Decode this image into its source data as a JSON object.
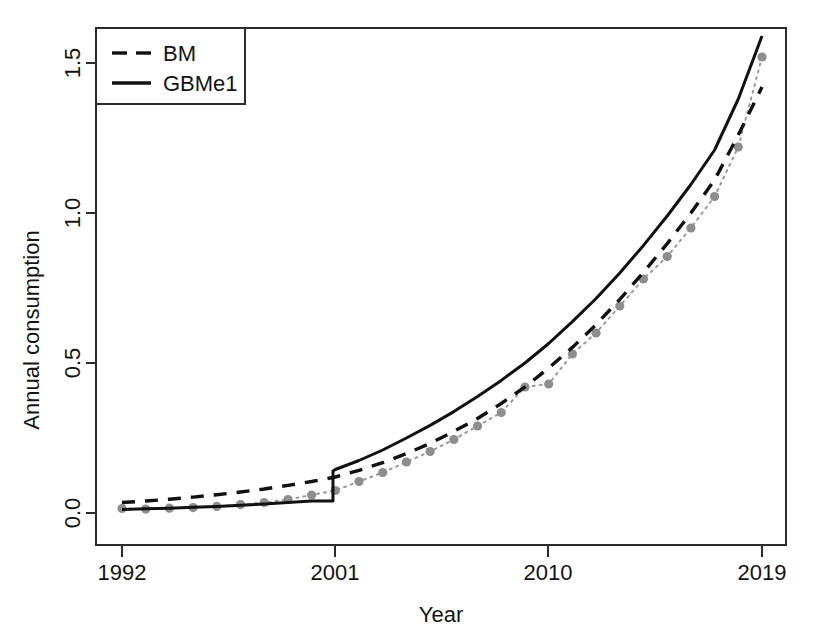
{
  "chart_data": {
    "type": "line",
    "title": "",
    "xlabel": "Year",
    "ylabel": "Annual consumption",
    "xlim": [
      1992,
      2019
    ],
    "ylim": [
      0.0,
      1.6
    ],
    "grid": false,
    "xticks": [
      1992,
      2001,
      2010,
      2019
    ],
    "xtick_labels": [
      "1992",
      "2001",
      "2010",
      "2019"
    ],
    "yticks": [
      0.0,
      0.5,
      1.0,
      1.5
    ],
    "ytick_labels": [
      "0.0",
      "0.5",
      "1.0",
      "1.5"
    ],
    "legend_position": "top-left",
    "legend_entries": [
      {
        "label": "BM",
        "style": "dashed",
        "color": "#111111"
      },
      {
        "label": "GBMe1",
        "style": "solid",
        "color": "#111111"
      }
    ],
    "x": [
      1992,
      1993,
      1994,
      1995,
      1996,
      1997,
      1998,
      1999,
      2000,
      2001,
      2002,
      2003,
      2004,
      2005,
      2006,
      2007,
      2008,
      2009,
      2010,
      2011,
      2012,
      2013,
      2014,
      2015,
      2016,
      2017,
      2018,
      2019
    ],
    "series": [
      {
        "name": "Observed",
        "style": "dotted-points",
        "color": "#8e8e8e",
        "values": [
          0.015,
          0.013,
          0.016,
          0.018,
          0.022,
          0.028,
          0.035,
          0.045,
          0.06,
          0.075,
          0.105,
          0.135,
          0.17,
          0.205,
          0.245,
          0.29,
          0.335,
          0.42,
          0.43,
          0.53,
          0.6,
          0.69,
          0.78,
          0.855,
          0.95,
          1.055,
          1.22,
          1.52
        ]
      },
      {
        "name": "BM",
        "style": "dashed",
        "color": "#111111",
        "values": [
          0.035,
          0.04,
          0.046,
          0.053,
          0.061,
          0.07,
          0.08,
          0.092,
          0.105,
          0.12,
          0.142,
          0.168,
          0.198,
          0.232,
          0.272,
          0.315,
          0.365,
          0.42,
          0.483,
          0.552,
          0.628,
          0.712,
          0.802,
          0.898,
          1.0,
          1.11,
          1.26,
          1.42
        ]
      },
      {
        "name": "GBMe1",
        "style": "solid",
        "color": "#111111",
        "values": [
          0.012,
          0.014,
          0.016,
          0.019,
          0.022,
          0.026,
          0.03,
          0.035,
          0.04,
          0.145,
          0.175,
          0.21,
          0.25,
          0.292,
          0.338,
          0.388,
          0.442,
          0.5,
          0.565,
          0.638,
          0.715,
          0.8,
          0.892,
          0.99,
          1.095,
          1.21,
          1.38,
          1.59
        ]
      }
    ],
    "annotations": {
      "step_change_year": 2000,
      "step_from": 0.04,
      "step_to": 0.14
    }
  }
}
